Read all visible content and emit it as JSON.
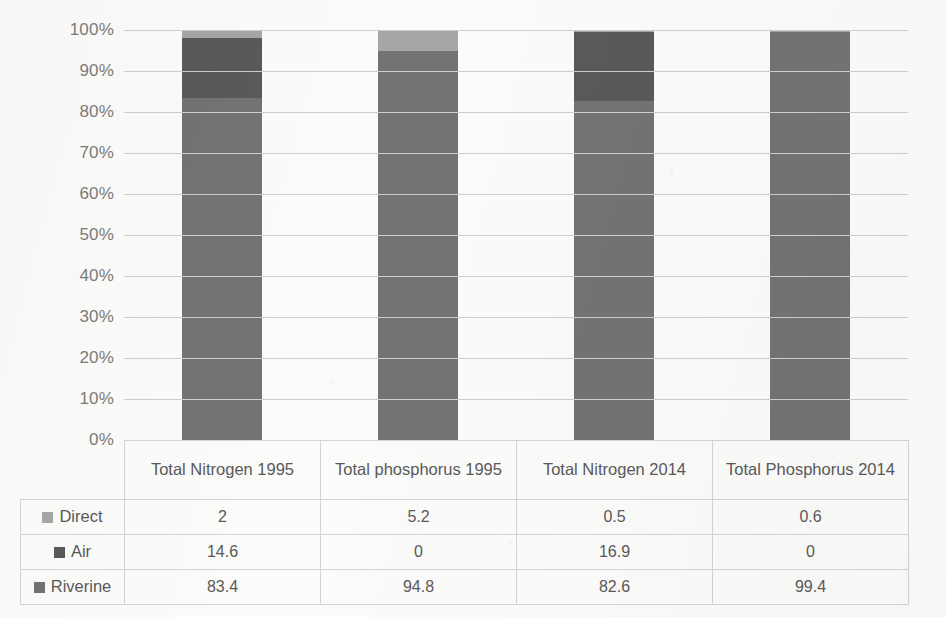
{
  "chart_data": {
    "type": "bar",
    "subtype": "stacked-100-percent-column",
    "title": "",
    "xlabel": "",
    "ylabel": "",
    "ylim": [
      0,
      100
    ],
    "ytick_labels": [
      "100%",
      "90%",
      "80%",
      "70%",
      "60%",
      "50%",
      "40%",
      "30%",
      "20%",
      "10%",
      "0%"
    ],
    "ytick_values": [
      100,
      90,
      80,
      70,
      60,
      50,
      40,
      30,
      20,
      10,
      0
    ],
    "grid": true,
    "legend_position": "data-table-row-labels",
    "categories": [
      "Total Nitrogen 1995",
      "Total phosphorus 1995",
      "Total Nitrogen 2014",
      "Total Phosphorus 2014"
    ],
    "series": [
      {
        "name": "Direct",
        "color": "#a6a6a6",
        "values": [
          2,
          5.2,
          0.5,
          0.6
        ]
      },
      {
        "name": "Air",
        "color": "#595959",
        "values": [
          14.6,
          0,
          16.9,
          0
        ]
      },
      {
        "name": "Riverine",
        "color": "#737373",
        "values": [
          83.4,
          94.8,
          82.6,
          99.4
        ]
      }
    ],
    "stack_order_bottom_to_top": [
      "Riverine",
      "Air",
      "Direct"
    ],
    "data_table": {
      "row_headers": [
        "Direct",
        "Air",
        "Riverine"
      ],
      "column_headers": [
        "Total Nitrogen 1995",
        "Total phosphorus 1995",
        "Total Nitrogen 2014",
        "Total Phosphorus 2014"
      ],
      "rows": [
        {
          "label": "Direct",
          "swatch": "#a6a6a6",
          "cells": [
            "2",
            "5.2",
            "0.5",
            "0.6"
          ]
        },
        {
          "label": "Air",
          "swatch": "#595959",
          "cells": [
            "14.6",
            "0",
            "16.9",
            "0"
          ]
        },
        {
          "label": "Riverine",
          "swatch": "#737373",
          "cells": [
            "83.4",
            "94.8",
            "82.6",
            "99.4"
          ]
        }
      ]
    }
  },
  "colors": {
    "background": "#fbfbfa",
    "gridline": "#cdcdcd",
    "axis_text": "#7b7b7b",
    "table_text": "#595959",
    "table_border": "#d4d4d4"
  }
}
